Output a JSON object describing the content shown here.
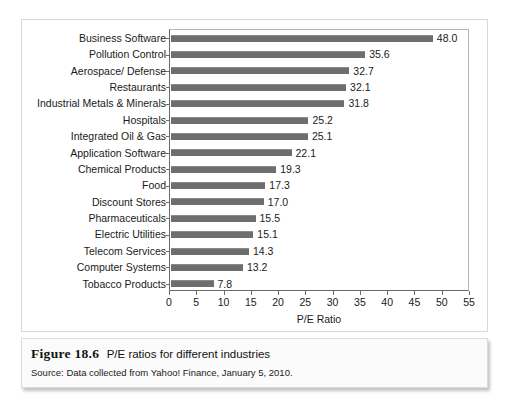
{
  "chart_data": {
    "type": "bar",
    "orientation": "horizontal",
    "title": "",
    "xlabel": "P/E Ratio",
    "ylabel": "",
    "xlim": [
      0,
      55
    ],
    "xticks": [
      0,
      5,
      10,
      15,
      20,
      25,
      30,
      35,
      40,
      45,
      50,
      55
    ],
    "grid": false,
    "legend": null,
    "bar_color": "#6e6e6e",
    "categories": [
      "Business Software",
      "Pollution Control",
      "Aerospace/ Defense",
      "Restaurants",
      "Industrial Metals & Minerals",
      "Hospitals",
      "Integrated Oil & Gas",
      "Application Software",
      "Chemical Products",
      "Food",
      "Discount Stores",
      "Pharmaceuticals",
      "Electric Utilities",
      "Telecom Services",
      "Computer Systems",
      "Tobacco Products"
    ],
    "values": [
      48.0,
      35.6,
      32.7,
      32.1,
      31.8,
      25.2,
      25.1,
      22.1,
      19.3,
      17.3,
      17.0,
      15.5,
      15.1,
      14.3,
      13.2,
      7.8
    ],
    "value_labels": [
      "48.0",
      "35.6",
      "32.7",
      "32.1",
      "31.8",
      "25.2",
      "25.1",
      "22.1",
      "19.3",
      "17.3",
      "17.0",
      "15.5",
      "15.1",
      "14.3",
      "13.2",
      "7.8"
    ]
  },
  "caption": {
    "figure_number": "Figure 18.6",
    "figure_title": "P/E ratios for different industries",
    "source": "Source: Data collected from Yahoo! Finance, January 5, 2010."
  }
}
